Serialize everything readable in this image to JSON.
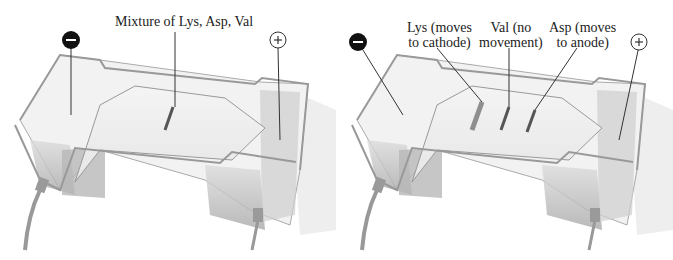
{
  "panels": [
    {
      "id": "before",
      "labels": {
        "mixture": "Mixture of Lys, Asp, Val"
      },
      "electrodes": {
        "negative": "−",
        "positive": "+"
      }
    },
    {
      "id": "after",
      "labels": {
        "lys_line1": "Lys (moves",
        "lys_line2": "to cathode)",
        "val_line1": "Val (no",
        "val_line2": "movement)",
        "asp_line1": "Asp (moves",
        "asp_line2": "to anode)"
      },
      "electrodes": {
        "negative": "−",
        "positive": "+"
      }
    }
  ],
  "colors": {
    "tank_outline": "#9a9a9a",
    "buffer": "#c8c8c8",
    "band": "#555555",
    "electrode_neg": "#111111"
  }
}
